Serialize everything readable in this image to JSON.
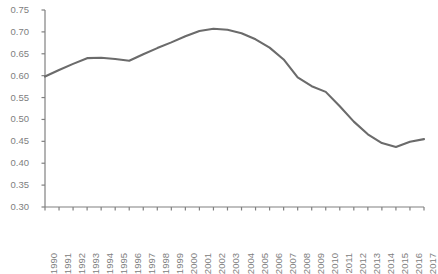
{
  "chart_data": {
    "type": "line",
    "title": "",
    "subtitle": "",
    "xlabel": "",
    "ylabel": "",
    "grid": false,
    "legend": null,
    "legend_position": "none",
    "line_color": "#6b6b6b",
    "axis_color": "#808080",
    "tick_label_color": "#808080",
    "background_color": "#ffffff",
    "xlim": [
      1990,
      2017
    ],
    "ylim": [
      0.3,
      0.75
    ],
    "ytick_step": 0.05,
    "yticks": [
      0.3,
      0.35,
      0.4,
      0.45,
      0.5,
      0.55,
      0.6,
      0.65,
      0.7,
      0.75
    ],
    "ytick_labels": [
      "0.30",
      "0.35",
      "0.40",
      "0.45",
      "0.50",
      "0.55",
      "0.60",
      "0.65",
      "0.70",
      "0.75"
    ],
    "categories": [
      "1990",
      "1991",
      "1992",
      "1993",
      "1994",
      "1995",
      "1996",
      "1997",
      "1998",
      "1999",
      "2000",
      "2001",
      "2002",
      "2003",
      "2004",
      "2005",
      "2006",
      "2007",
      "2008",
      "2009",
      "2010",
      "2011",
      "2012",
      "2013",
      "2014",
      "2015",
      "2016",
      "2017"
    ],
    "x": [
      1990,
      1991,
      1992,
      1993,
      1994,
      1995,
      1996,
      1997,
      1998,
      1999,
      2000,
      2001,
      2002,
      2003,
      2004,
      2005,
      2006,
      2007,
      2008,
      2009,
      2010,
      2011,
      2012,
      2013,
      2014,
      2015,
      2016,
      2017
    ],
    "values": [
      0.598,
      0.613,
      0.627,
      0.64,
      0.641,
      0.638,
      0.634,
      0.649,
      0.663,
      0.676,
      0.69,
      0.702,
      0.707,
      0.705,
      0.697,
      0.683,
      0.664,
      0.637,
      0.596,
      0.576,
      0.563,
      0.53,
      0.495,
      0.466,
      0.446,
      0.437,
      0.449,
      0.455
    ],
    "series": [
      {
        "name": "series-1",
        "color": "#6b6b6b",
        "values": [
          0.598,
          0.613,
          0.627,
          0.64,
          0.641,
          0.638,
          0.634,
          0.649,
          0.663,
          0.676,
          0.69,
          0.702,
          0.707,
          0.705,
          0.697,
          0.683,
          0.664,
          0.637,
          0.596,
          0.576,
          0.563,
          0.53,
          0.495,
          0.466,
          0.446,
          0.437,
          0.449,
          0.455
        ]
      }
    ]
  }
}
